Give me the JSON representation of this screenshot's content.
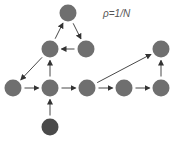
{
  "label": "ρ=1/N",
  "colors": {
    "node": "#6f6f6f",
    "start_node": "#4a4a4a",
    "edge": "#333333"
  },
  "nodes": [
    {
      "id": "top",
      "x": 68,
      "y": 13,
      "kind": "node"
    },
    {
      "id": "mid_left",
      "x": 50,
      "y": 49,
      "kind": "node"
    },
    {
      "id": "mid_right",
      "x": 86,
      "y": 49,
      "kind": "node"
    },
    {
      "id": "right_top",
      "x": 161,
      "y": 49,
      "kind": "node"
    },
    {
      "id": "r0",
      "x": 13,
      "y": 88,
      "kind": "node"
    },
    {
      "id": "r1",
      "x": 50,
      "y": 88,
      "kind": "node"
    },
    {
      "id": "r2",
      "x": 87,
      "y": 88,
      "kind": "node"
    },
    {
      "id": "r3",
      "x": 124,
      "y": 88,
      "kind": "node"
    },
    {
      "id": "r4",
      "x": 161,
      "y": 88,
      "kind": "node"
    },
    {
      "id": "bottom",
      "x": 50,
      "y": 127,
      "kind": "start_node"
    }
  ],
  "edges": [
    {
      "from": "bottom",
      "to": "r1"
    },
    {
      "from": "r0",
      "to": "r1"
    },
    {
      "from": "r1",
      "to": "r2"
    },
    {
      "from": "r1",
      "to": "mid_left"
    },
    {
      "from": "r2",
      "to": "r3"
    },
    {
      "from": "r3",
      "to": "r4"
    },
    {
      "from": "r4",
      "to": "right_top"
    },
    {
      "from": "r2",
      "to": "right_top"
    },
    {
      "from": "mid_left",
      "to": "top"
    },
    {
      "from": "top",
      "to": "mid_right"
    },
    {
      "from": "mid_right",
      "to": "mid_left"
    },
    {
      "from": "mid_left",
      "to": "r0"
    }
  ]
}
